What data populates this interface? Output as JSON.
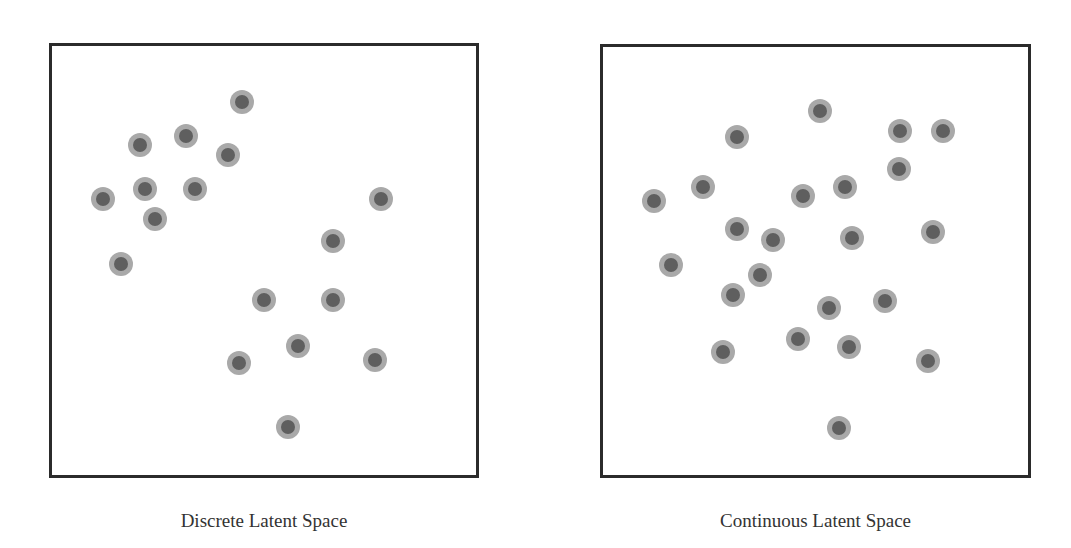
{
  "panels": [
    {
      "caption": "Discrete Latent Space",
      "frame": {
        "left": 49,
        "top": 43,
        "width": 430,
        "height": 435
      },
      "points": [
        [
          242,
          102
        ],
        [
          186,
          136
        ],
        [
          140,
          145
        ],
        [
          228,
          155
        ],
        [
          103,
          199
        ],
        [
          145,
          189
        ],
        [
          195,
          189
        ],
        [
          155,
          219
        ],
        [
          121,
          264
        ],
        [
          381,
          199
        ],
        [
          333,
          241
        ],
        [
          264,
          300
        ],
        [
          333,
          300
        ],
        [
          298,
          346
        ],
        [
          239,
          363
        ],
        [
          375,
          360
        ],
        [
          288,
          427
        ]
      ]
    },
    {
      "caption": "Continuous Latent Space",
      "frame": {
        "left": 600,
        "top": 44,
        "width": 431,
        "height": 434
      },
      "points": [
        [
          820,
          111
        ],
        [
          737,
          137
        ],
        [
          900,
          131
        ],
        [
          943,
          131
        ],
        [
          899,
          169
        ],
        [
          703,
          187
        ],
        [
          654,
          201
        ],
        [
          803,
          196
        ],
        [
          845,
          187
        ],
        [
          737,
          229
        ],
        [
          773,
          240
        ],
        [
          852,
          238
        ],
        [
          933,
          232
        ],
        [
          671,
          265
        ],
        [
          760,
          275
        ],
        [
          733,
          295
        ],
        [
          829,
          308
        ],
        [
          885,
          301
        ],
        [
          798,
          339
        ],
        [
          849,
          347
        ],
        [
          723,
          352
        ],
        [
          928,
          361
        ],
        [
          839,
          428
        ]
      ]
    }
  ],
  "colors": {
    "frame": "#2b2b2b",
    "dot_outer": "#a9a9a9",
    "dot_inner": "#5f5f5f"
  }
}
